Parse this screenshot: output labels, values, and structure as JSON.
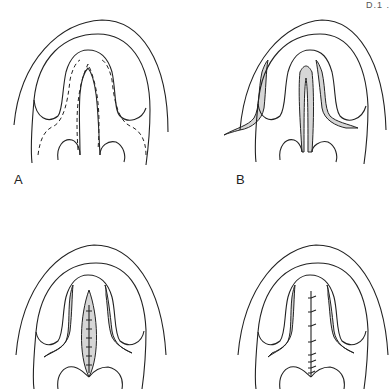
{
  "figure": {
    "corner_fragment": "D.1 .",
    "stroke_color": "#222222",
    "shade_color": "#d6d6d6",
    "panels": [
      {
        "id": "A",
        "label": "A",
        "description": "Palatal outline with dashed incision lines around cleft and along lateral flaps"
      },
      {
        "id": "B",
        "label": "B",
        "description": "Flaps raised; shaded raw areas along cleft margins and lateral releasing incisions"
      },
      {
        "id": "C",
        "label": "",
        "description": "Nasal layer closed with sutures; shaded spindle-shaped central area"
      },
      {
        "id": "D",
        "label": "",
        "description": "Oral layer closed along midline with interrupted sutures; lateral raw areas shaded"
      }
    ]
  }
}
